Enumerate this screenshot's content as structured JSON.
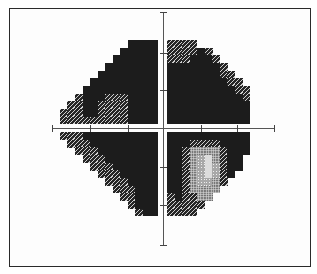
{
  "chart_data": {
    "type": "heatmap",
    "title": "",
    "xlabel": "",
    "ylabel": "",
    "grid": false,
    "legend": null,
    "shade_levels": {
      "0": "blank (outside field)",
      "1": "black (dense defect)",
      "2": "dark hatched",
      "3": "mid stippled",
      "4": "light grey",
      "5": "near white"
    },
    "colors": {
      "1": "#1c1c1c",
      "2": "#262626",
      "3": "#6e6e6e",
      "4": "#a8a8a8",
      "5": "#dcdcdc",
      "frame": "#2a2a2a",
      "axis": "#555555"
    },
    "quadrants": {
      "upper_left": [
        [
          0,
          0,
          0,
          0,
          0,
          0,
          0,
          0,
          0,
          1,
          1,
          1,
          1
        ],
        [
          0,
          0,
          0,
          0,
          0,
          0,
          0,
          0,
          1,
          1,
          1,
          1,
          1
        ],
        [
          0,
          0,
          0,
          0,
          0,
          0,
          0,
          1,
          1,
          1,
          1,
          1,
          1
        ],
        [
          0,
          0,
          0,
          0,
          0,
          0,
          1,
          1,
          1,
          1,
          1,
          1,
          1
        ],
        [
          0,
          0,
          0,
          0,
          0,
          1,
          1,
          1,
          1,
          1,
          1,
          1,
          1
        ],
        [
          0,
          0,
          0,
          0,
          1,
          1,
          1,
          1,
          1,
          1,
          1,
          1,
          1
        ],
        [
          0,
          0,
          0,
          1,
          1,
          1,
          1,
          1,
          1,
          1,
          1,
          1,
          1
        ],
        [
          0,
          0,
          2,
          1,
          1,
          1,
          2,
          2,
          2,
          1,
          1,
          1,
          1
        ],
        [
          0,
          2,
          2,
          1,
          1,
          2,
          2,
          2,
          2,
          1,
          1,
          1,
          1
        ],
        [
          2,
          2,
          2,
          1,
          1,
          2,
          2,
          2,
          2,
          1,
          1,
          1,
          1
        ],
        [
          2,
          2,
          2,
          2,
          2,
          2,
          2,
          2,
          2,
          1,
          1,
          1,
          1
        ]
      ],
      "upper_right": [
        [
          2,
          2,
          2,
          2,
          0,
          0,
          0,
          0,
          0,
          0,
          0
        ],
        [
          2,
          2,
          2,
          2,
          1,
          2,
          0,
          0,
          0,
          0,
          0
        ],
        [
          2,
          2,
          2,
          1,
          1,
          1,
          2,
          0,
          0,
          0,
          0
        ],
        [
          1,
          1,
          1,
          1,
          1,
          1,
          1,
          2,
          0,
          0,
          0
        ],
        [
          1,
          1,
          1,
          1,
          1,
          1,
          1,
          2,
          2,
          0,
          0
        ],
        [
          1,
          1,
          1,
          1,
          1,
          1,
          1,
          1,
          2,
          2,
          0
        ],
        [
          1,
          1,
          1,
          1,
          1,
          1,
          1,
          1,
          1,
          2,
          2
        ],
        [
          1,
          1,
          1,
          1,
          1,
          1,
          1,
          1,
          1,
          1,
          2
        ],
        [
          1,
          1,
          1,
          1,
          1,
          1,
          1,
          1,
          1,
          1,
          1
        ],
        [
          1,
          1,
          1,
          1,
          1,
          1,
          1,
          1,
          1,
          1,
          1
        ],
        [
          1,
          1,
          1,
          1,
          1,
          1,
          1,
          1,
          1,
          1,
          1
        ]
      ],
      "lower_left": [
        [
          2,
          2,
          2,
          1,
          1,
          1,
          1,
          1,
          1,
          1,
          1,
          1,
          1
        ],
        [
          0,
          2,
          2,
          2,
          1,
          1,
          1,
          1,
          1,
          1,
          1,
          1,
          1
        ],
        [
          0,
          0,
          2,
          2,
          2,
          1,
          1,
          1,
          1,
          1,
          1,
          1,
          1
        ],
        [
          0,
          0,
          0,
          2,
          2,
          2,
          1,
          1,
          1,
          1,
          1,
          1,
          1
        ],
        [
          0,
          0,
          0,
          0,
          2,
          2,
          2,
          1,
          1,
          1,
          1,
          1,
          1
        ],
        [
          0,
          0,
          0,
          0,
          0,
          2,
          2,
          2,
          1,
          1,
          1,
          1,
          1
        ],
        [
          0,
          0,
          0,
          0,
          0,
          0,
          2,
          2,
          2,
          1,
          1,
          1,
          1
        ],
        [
          0,
          0,
          0,
          0,
          0,
          0,
          0,
          2,
          2,
          2,
          1,
          1,
          1
        ],
        [
          0,
          0,
          0,
          0,
          0,
          0,
          0,
          0,
          2,
          2,
          1,
          1,
          1
        ],
        [
          0,
          0,
          0,
          0,
          0,
          0,
          0,
          0,
          0,
          2,
          1,
          1,
          1
        ],
        [
          0,
          0,
          0,
          0,
          0,
          0,
          0,
          0,
          0,
          0,
          2,
          1,
          1
        ]
      ],
      "lower_right": [
        [
          1,
          1,
          1,
          1,
          1,
          1,
          1,
          1,
          1,
          1,
          1
        ],
        [
          1,
          1,
          1,
          2,
          2,
          2,
          2,
          1,
          1,
          1,
          1
        ],
        [
          1,
          1,
          2,
          3,
          3,
          3,
          3,
          2,
          1,
          1,
          1
        ],
        [
          1,
          1,
          2,
          3,
          4,
          5,
          3,
          2,
          1,
          1,
          0
        ],
        [
          1,
          1,
          2,
          3,
          4,
          5,
          4,
          2,
          1,
          1,
          0
        ],
        [
          1,
          1,
          2,
          3,
          4,
          5,
          4,
          2,
          1,
          0,
          0
        ],
        [
          1,
          1,
          2,
          3,
          4,
          4,
          3,
          2,
          0,
          0,
          0
        ],
        [
          1,
          1,
          2,
          3,
          3,
          3,
          3,
          0,
          0,
          0,
          0
        ],
        [
          2,
          1,
          2,
          2,
          3,
          3,
          0,
          0,
          0,
          0,
          0
        ],
        [
          2,
          2,
          2,
          2,
          2,
          0,
          0,
          0,
          0,
          0,
          0
        ],
        [
          2,
          2,
          2,
          2,
          0,
          0,
          0,
          0,
          0,
          0,
          0
        ]
      ]
    },
    "axes": {
      "horizontal": {
        "y": 128,
        "x_start": 52,
        "x_end": 274,
        "ticks_x": [
          90,
          128,
          201,
          237
        ]
      },
      "vertical": {
        "x": 163,
        "y_start": 12,
        "y_end": 245,
        "ticks_y": [
          53,
          90,
          167,
          205
        ]
      }
    }
  }
}
